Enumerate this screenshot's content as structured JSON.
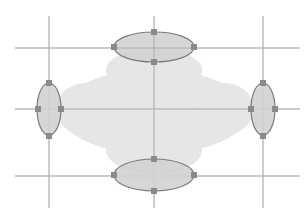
{
  "diagram": {
    "title": "",
    "colors": {
      "background": "#ffffff",
      "cloud_fill": "#e6e6e6",
      "grid_line": "#b8b8b8",
      "ellipse_fill": "#d2d2d2",
      "ellipse_stroke": "#7a7a7a",
      "handle_fill": "#8a8a8a"
    },
    "grid": {
      "vertical_x": [
        49,
        154,
        263
      ],
      "horizontal_y": [
        48,
        109,
        176
      ],
      "v_extent": [
        16,
        208
      ],
      "h_extent": [
        15,
        300
      ]
    },
    "ellipses": [
      {
        "id": "top",
        "cx": 154,
        "cy": 47,
        "rx": 40,
        "ry": 15
      },
      {
        "id": "left",
        "cx": 49,
        "cy": 109,
        "rx": 12,
        "ry": 26
      },
      {
        "id": "right",
        "cx": 263,
        "cy": 109,
        "rx": 12,
        "ry": 26
      },
      {
        "id": "bottom",
        "cx": 154,
        "cy": 175,
        "rx": 40,
        "ry": 16
      }
    ]
  }
}
